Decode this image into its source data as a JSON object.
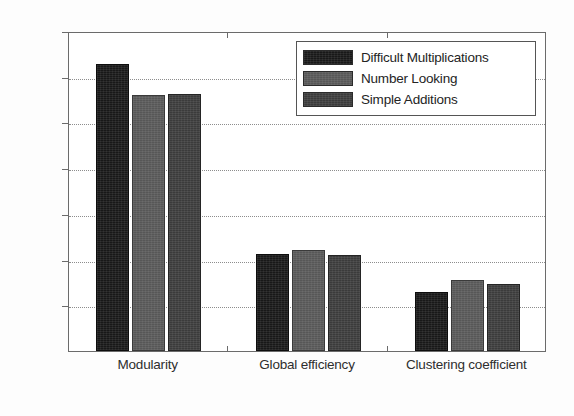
{
  "chart_data": {
    "type": "bar",
    "title": "",
    "xlabel": "",
    "ylabel": "",
    "categories": [
      "Modularity",
      "Global efficiency",
      "Clustering coefficient"
    ],
    "series": [
      {
        "name": "Difficult Multiplications",
        "color": "#181818",
        "values": [
          0.314,
          0.106,
          0.065
        ]
      },
      {
        "name": "Number Looking",
        "color": "#575757",
        "values": [
          0.28,
          0.11,
          0.078
        ]
      },
      {
        "name": "Simple Additions",
        "color": "#3b3b3b",
        "values": [
          0.281,
          0.105,
          0.073
        ]
      }
    ],
    "ylim": [
      0,
      0.35
    ],
    "yticks": [
      0,
      0.05,
      0.1,
      0.15,
      0.2,
      0.25,
      0.3,
      0.35
    ],
    "ytick_labels": [
      "0",
      "0.05",
      "0.1",
      "0.15",
      "0.2",
      "0.25",
      "0.3",
      "0.35"
    ],
    "grid": "horizontal-dotted",
    "legend_position": "top-right"
  },
  "legend": {
    "entries": [
      {
        "label": "Difficult Multiplications"
      },
      {
        "label": "Number Looking"
      },
      {
        "label": "Simple Additions"
      }
    ]
  },
  "axis": {
    "y_labels": [
      "0.35",
      "0.3",
      "0.25",
      "0.2",
      "0.15",
      "0.1",
      "0.05",
      "0"
    ],
    "x_labels": [
      "Modularity",
      "Global efficiency",
      "Clustering coefficient"
    ]
  }
}
